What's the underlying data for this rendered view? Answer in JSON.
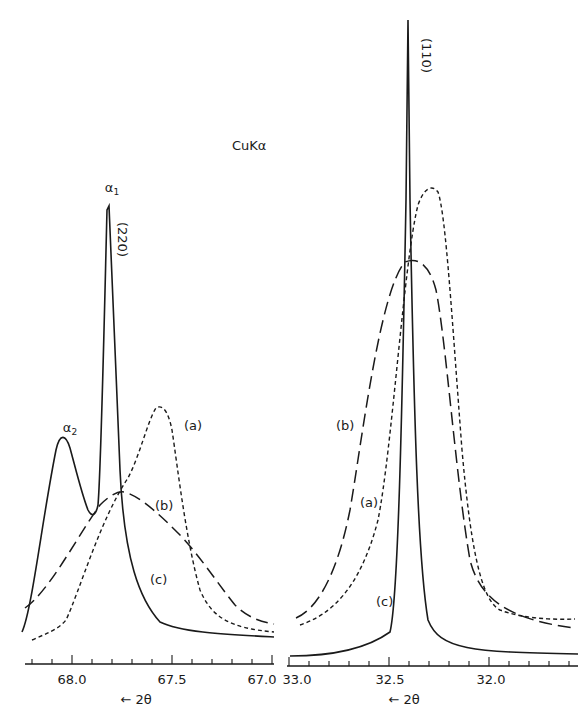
{
  "figure": {
    "radiation_label": "CuKα",
    "direction_label": "← 2θ"
  },
  "chart_data": [
    {
      "type": "line",
      "panel": "left",
      "title": "(220) reflection, CuKα",
      "xlabel": "← 2θ",
      "ylabel": "",
      "xlim": [
        68.2,
        67.0
      ],
      "x_ticks": [
        "68.0",
        "67.5",
        "67.0"
      ],
      "x_ticks_numeric": [
        68.0,
        67.5,
        67.0
      ],
      "grid": false,
      "annotations": [
        "α1",
        "α2",
        "(220)",
        "(a)",
        "(b)",
        "(c)"
      ],
      "series": [
        {
          "name": "(a)",
          "style": "short-dash",
          "x": [
            68.18,
            68.0,
            67.9,
            67.8,
            67.7,
            67.6,
            67.55,
            67.5,
            67.45,
            67.4,
            67.35,
            67.3,
            67.2,
            67.1,
            67.0
          ],
          "values": [
            0.03,
            0.07,
            0.22,
            0.45,
            0.68,
            0.88,
            0.95,
            0.92,
            0.75,
            0.45,
            0.22,
            0.12,
            0.06,
            0.04,
            0.03
          ]
        },
        {
          "name": "(b)",
          "style": "long-dash",
          "x": [
            68.18,
            68.0,
            67.9,
            67.8,
            67.75,
            67.7,
            67.6,
            67.5,
            67.4,
            67.3,
            67.2,
            67.1,
            67.0
          ],
          "values": [
            0.08,
            0.24,
            0.4,
            0.52,
            0.54,
            0.53,
            0.46,
            0.36,
            0.26,
            0.16,
            0.09,
            0.06,
            0.05
          ]
        },
        {
          "name": "(c)",
          "style": "solid",
          "x": [
            68.18,
            68.08,
            68.03,
            68.0,
            67.95,
            67.9,
            67.87,
            67.84,
            67.82,
            67.8,
            67.78,
            67.75,
            67.7,
            67.6,
            67.5,
            67.3,
            67.0
          ],
          "values": [
            0.05,
            0.35,
            0.64,
            0.62,
            0.4,
            0.3,
            0.5,
            1.0,
            1.0,
            0.75,
            0.45,
            0.28,
            0.17,
            0.1,
            0.06,
            0.03,
            0.02
          ]
        }
      ]
    },
    {
      "type": "line",
      "panel": "right",
      "title": "(110) reflection",
      "xlabel": "← 2θ",
      "ylabel": "",
      "xlim": [
        33.0,
        31.7
      ],
      "x_ticks": [
        "33.0",
        "32.5",
        "32.0"
      ],
      "x_ticks_numeric": [
        33.0,
        32.5,
        32.0
      ],
      "grid": false,
      "annotations": [
        "(110)",
        "(a)",
        "(b)",
        "(c)"
      ],
      "series": [
        {
          "name": "(a)",
          "style": "short-dash",
          "x": [
            33.0,
            32.9,
            32.8,
            32.7,
            32.6,
            32.5,
            32.45,
            32.4,
            32.35,
            32.3,
            32.25,
            32.2,
            32.1,
            32.0,
            31.9,
            31.75
          ],
          "values": [
            0.06,
            0.1,
            0.18,
            0.34,
            0.6,
            0.85,
            0.95,
            0.98,
            1.0,
            0.97,
            0.85,
            0.62,
            0.3,
            0.15,
            0.09,
            0.06
          ]
        },
        {
          "name": "(b)",
          "style": "long-dash",
          "x": [
            33.0,
            32.9,
            32.8,
            32.7,
            32.6,
            32.5,
            32.4,
            32.35,
            32.3,
            32.2,
            32.1,
            32.0,
            31.9,
            31.75
          ],
          "values": [
            0.08,
            0.18,
            0.35,
            0.58,
            0.78,
            0.92,
            0.98,
            0.97,
            0.9,
            0.65,
            0.35,
            0.16,
            0.09,
            0.06
          ]
        },
        {
          "name": "(c)",
          "style": "solid",
          "x": [
            33.0,
            32.8,
            32.6,
            32.5,
            32.45,
            32.42,
            32.4,
            32.38,
            32.35,
            32.3,
            32.25,
            32.2,
            32.1,
            32.0,
            31.75
          ],
          "values": [
            0.01,
            0.02,
            0.06,
            0.15,
            0.4,
            0.75,
            1.0,
            0.75,
            0.4,
            0.2,
            0.1,
            0.05,
            0.02,
            0.02,
            0.01
          ]
        }
      ]
    }
  ]
}
